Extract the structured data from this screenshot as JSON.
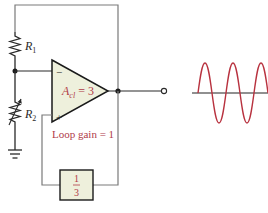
{
  "diagram": {
    "colors": {
      "wire": "#2a2a2a",
      "frame_wire": "#7a7a7a",
      "opamp_fill": "#eef0dc",
      "label_red": "#b03a48",
      "sine": "#b8323f",
      "axis": "#222222"
    },
    "labels": {
      "r1": "R",
      "r1_sub": "1",
      "r2": "R",
      "r2_sub": "2",
      "gain_a": "A",
      "gain_sub": "cl",
      "gain_value": " = 3",
      "minus": "−",
      "plus": "+",
      "loop_gain": "Loop gain = 1",
      "feedback_num": "1",
      "feedback_den": "3"
    },
    "components": [
      {
        "id": "R1",
        "type": "resistor"
      },
      {
        "id": "R2",
        "type": "potentiometer"
      },
      {
        "id": "opamp",
        "type": "op-amp",
        "gain": "Acl = 3"
      },
      {
        "id": "feedback",
        "type": "network",
        "gain": "1/3"
      },
      {
        "id": "ground",
        "type": "ground"
      },
      {
        "id": "output-terminal",
        "type": "terminal"
      }
    ],
    "waveform": {
      "type": "sine",
      "cycles": 3
    }
  }
}
